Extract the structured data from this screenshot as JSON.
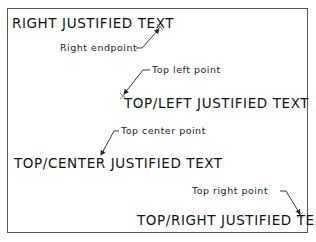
{
  "diagram": {
    "texts": [
      {
        "id": "right",
        "label": "RIGHT JUSTIFIED TEXT"
      },
      {
        "id": "top_left",
        "label": "TOP/LEFT JUSTIFIED TEXT"
      },
      {
        "id": "top_center",
        "label": "TOP/CENTER JUSTIFIED TEXT"
      },
      {
        "id": "top_right",
        "label": "TOP/RIGHT JUSTIFIED TEXT"
      }
    ],
    "callouts": [
      {
        "id": "right_endpoint",
        "label": "Right endpoint"
      },
      {
        "id": "top_left_point",
        "label": "Top left point"
      },
      {
        "id": "top_center_point",
        "label": "Top center point"
      },
      {
        "id": "top_right_point",
        "label": "Top right point"
      }
    ],
    "colors": {
      "line": "#222222",
      "border": "#555555",
      "background": "#ffffff"
    }
  }
}
